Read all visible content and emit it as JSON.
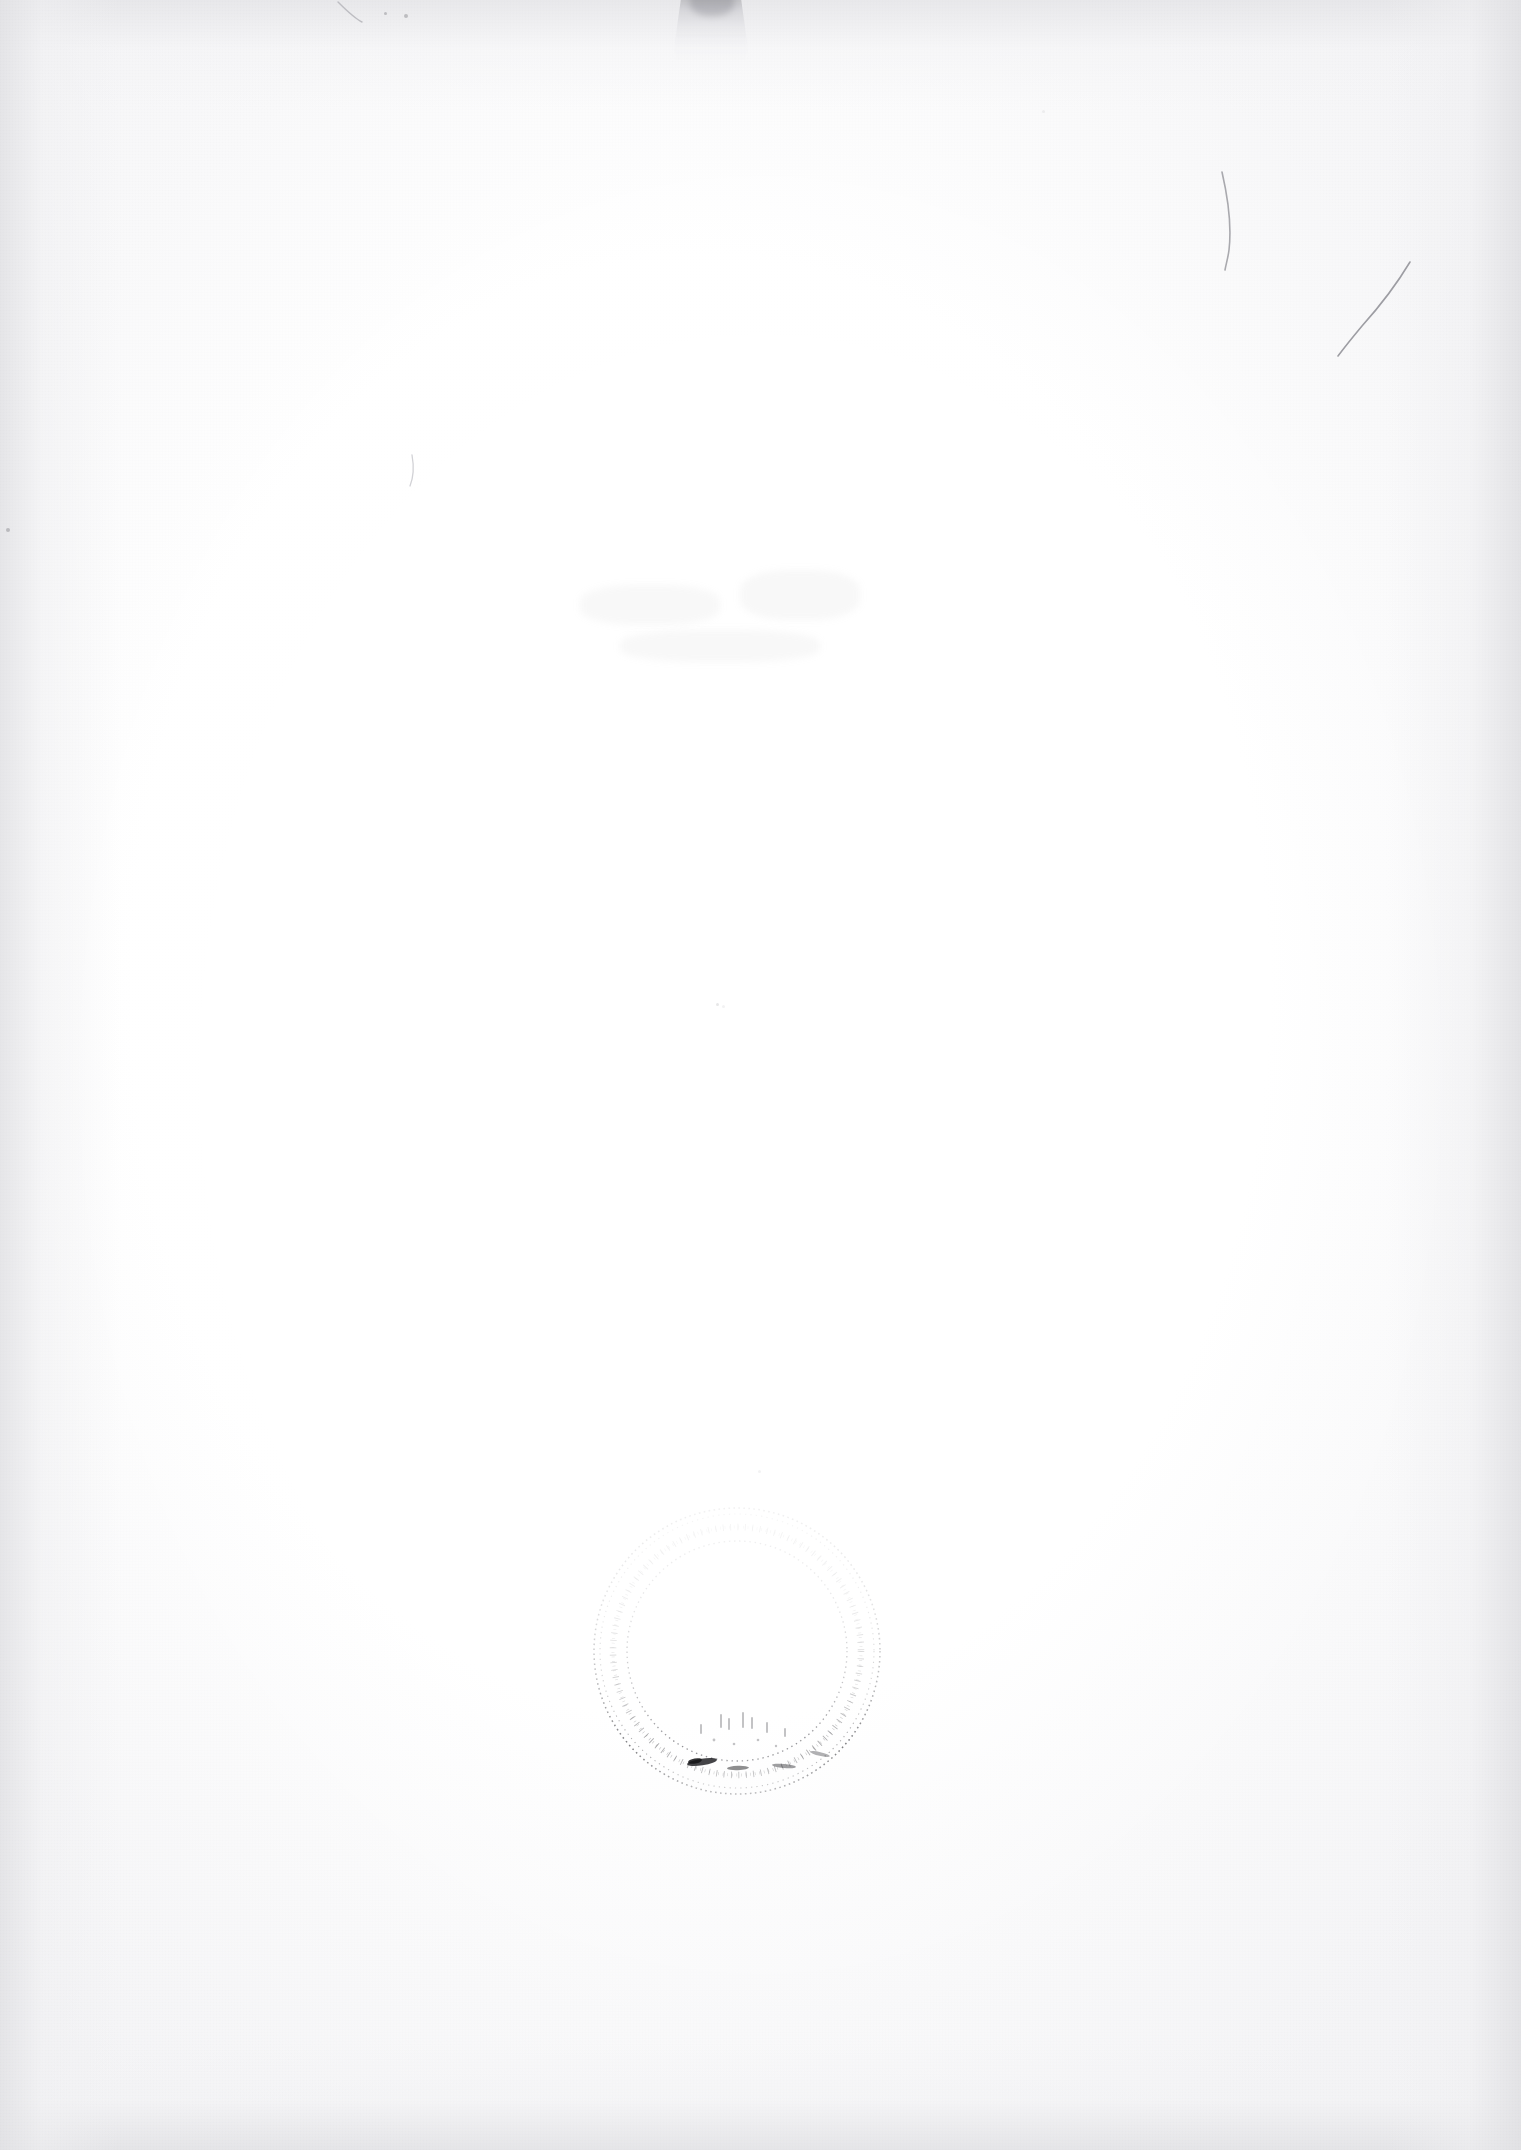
{
  "document": {
    "kind": "scanned-page",
    "description": "Blank verso of a scanned archival paper sheet",
    "page_width": 1521,
    "page_height": 2150,
    "visible_text": "",
    "background_color": "#ffffff",
    "paper_tone_color": "#f7f7f8",
    "edge_shadow_color": "#e2e2e5",
    "ink_color": "#3a3a3e"
  },
  "artifacts": {
    "top_shadow_notch": {
      "name": "top-edge-shadow-notch",
      "label": "",
      "x": 672,
      "y": 0,
      "width": 78,
      "height": 62,
      "color": "#96969b"
    },
    "pencil_marks": [
      {
        "name": "pencil-stroke-upper-right-1",
        "label": "",
        "path": "M 1222 172 C 1228 198, 1232 224, 1229 250 C 1228 258, 1226 264, 1225 270",
        "color": "#a9a9ae",
        "stroke_width": 1.6
      },
      {
        "name": "pencil-stroke-upper-right-2",
        "label": "",
        "path": "M 1410 262 C 1398 282, 1380 306, 1362 326 C 1352 338, 1344 348, 1338 356",
        "color": "#9d9da3",
        "stroke_width": 1.6
      },
      {
        "name": "pencil-stroke-top-left",
        "label": "",
        "path": "M 338 2 C 346 10, 354 18, 362 22",
        "color": "#bdbdc2",
        "stroke_width": 1.4
      },
      {
        "name": "pencil-stroke-mid-left",
        "label": "",
        "path": "M 412 455 C 414 466, 414 476, 410 486",
        "color": "#d2d2d6",
        "stroke_width": 1.3
      }
    ],
    "specks": [
      {
        "name": "speck-top-left-a",
        "x": 384,
        "y": 12,
        "size": 3,
        "opacity": "normal"
      },
      {
        "name": "speck-top-left-b",
        "x": 404,
        "y": 14,
        "size": 4,
        "opacity": "normal"
      },
      {
        "name": "speck-left-edge",
        "x": 6,
        "y": 528,
        "size": 4,
        "opacity": "normal"
      },
      {
        "name": "speck-upper-mid",
        "x": 716,
        "y": 1003,
        "size": 3,
        "opacity": "faint"
      },
      {
        "name": "speck-upper-mid-b",
        "x": 722,
        "y": 1005,
        "size": 3,
        "opacity": "vfaint"
      },
      {
        "name": "speck-top-right",
        "x": 1042,
        "y": 110,
        "size": 3,
        "opacity": "vfaint"
      },
      {
        "name": "speck-lower-mid",
        "x": 758,
        "y": 1470,
        "size": 3,
        "opacity": "vfaint"
      }
    ],
    "ghost_smudges": [
      {
        "name": "ghost-smudge-center-a",
        "x": 580,
        "y": 585,
        "width": 140,
        "height": 40
      },
      {
        "name": "ghost-smudge-center-b",
        "x": 740,
        "y": 570,
        "width": 120,
        "height": 50
      },
      {
        "name": "ghost-smudge-center-c",
        "x": 620,
        "y": 630,
        "width": 200,
        "height": 32
      }
    ],
    "stamp": {
      "name": "faded-circular-rubber-stamp",
      "label": "",
      "legible_text": "",
      "center_x": 737,
      "center_y": 1651,
      "outer_radius": 144,
      "inner_radius": 112,
      "ink_color": "#2f2f33",
      "shape": "circle",
      "condition": "heavily faded, rim text illegible, strongest impression along lower-left arc"
    }
  }
}
